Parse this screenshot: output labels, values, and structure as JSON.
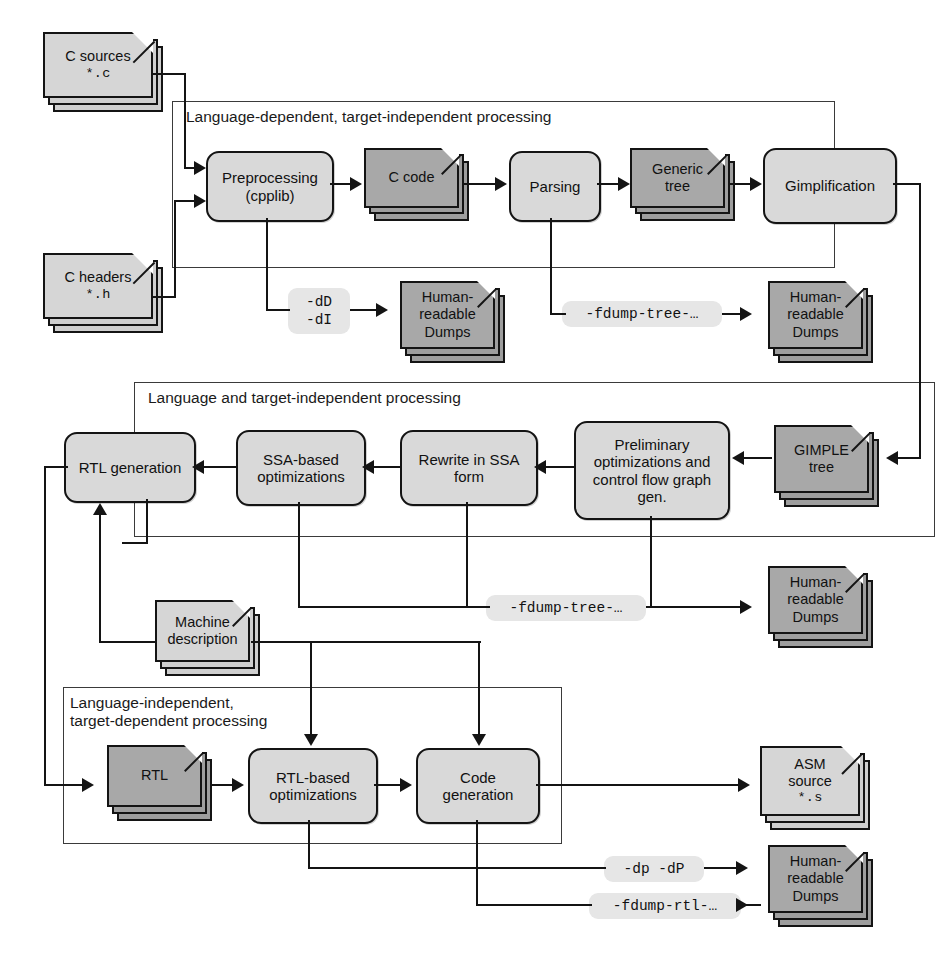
{
  "diagram": {
    "colors": {
      "process_fill": "#d9d9d9",
      "doc_light_fill": "#d6d6d6",
      "doc_dark_fill": "#a8a8a8",
      "pill_fill": "#e6e6e6",
      "stroke": "#141414",
      "frame_stroke": "#3a3a3a",
      "background": "#ffffff"
    },
    "groups": [
      {
        "id": "g1",
        "label": "Language-dependent, target-independent processing"
      },
      {
        "id": "g2",
        "label": "Language and target-independent processing"
      },
      {
        "id": "g3",
        "label": "Language-independent,\ntarget-dependent processing"
      }
    ],
    "inputs": [
      {
        "id": "c-sources",
        "line1": "C sources",
        "line2": "*.c"
      },
      {
        "id": "c-headers",
        "line1": "C headers",
        "line2": "*.h"
      }
    ],
    "stage1": {
      "preprocessing": {
        "line1": "Preprocessing",
        "line2": "(cpplib)"
      },
      "c_code": {
        "line1": "C code"
      },
      "parsing": {
        "line1": "Parsing"
      },
      "generic_tree": {
        "line1": "Generic",
        "line2": "tree"
      },
      "gimplification": {
        "line1": "Gimplification"
      }
    },
    "stage2": {
      "gimple_tree": {
        "line1": "GIMPLE",
        "line2": "tree"
      },
      "prelim_opt": {
        "line1": "Preliminary",
        "line2": "optimizations and",
        "line3": "control flow graph",
        "line4": "gen."
      },
      "rewrite_ssa": {
        "line1": "Rewrite in SSA",
        "line2": "form"
      },
      "ssa_opt": {
        "line1": "SSA-based",
        "line2": "optimizations"
      },
      "rtl_generation": {
        "line1": "RTL generation"
      }
    },
    "stage3": {
      "machine_description": {
        "line1": "Machine",
        "line2": "description"
      },
      "rtl": {
        "line1": "RTL"
      },
      "rtl_opt": {
        "line1": "RTL-based",
        "line2": "optimizations"
      },
      "code_generation": {
        "line1": "Code",
        "line2": "generation"
      },
      "asm_source": {
        "line1": "ASM",
        "line2": "source",
        "line3": "*.s"
      }
    },
    "dumps": {
      "label_l1": "Human-",
      "label_l2": "readable",
      "label_l3": "Dumps"
    },
    "flags": [
      {
        "id": "flag-dD-dI",
        "text": "-dD\n-dI"
      },
      {
        "id": "flag-fdump-tree-top",
        "text": "-fdump-tree-…"
      },
      {
        "id": "flag-fdump-tree-mid",
        "text": "-fdump-tree-…"
      },
      {
        "id": "flag-dp-dP",
        "text": "-dp  -dP"
      },
      {
        "id": "flag-fdump-rtl",
        "text": "-fdump-rtl-…"
      }
    ]
  }
}
